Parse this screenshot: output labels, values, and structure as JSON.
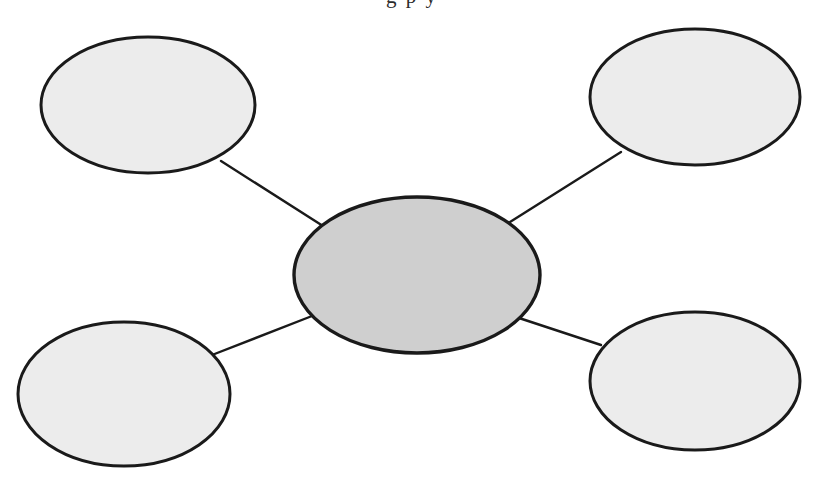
{
  "page": {
    "background_color": "#ffffff",
    "width": 824,
    "height": 480
  },
  "heading": {
    "clipped_fragment": "g p y",
    "note": "partially cropped text at top edge"
  },
  "style": {
    "outline_color": "#1a1a1a",
    "center_fill": "#cfcfcf",
    "outer_fill": "#ececec",
    "connector_color": "#1a1a1a",
    "outline_width": 3,
    "connector_width": 2
  },
  "diagram": {
    "type": "bubble-map",
    "center_node": {
      "id": "center",
      "label": "",
      "cx": 417,
      "cy": 275,
      "rx": 123,
      "ry": 78,
      "fill": "#cfcfcf"
    },
    "outer_nodes": [
      {
        "id": "top-left",
        "label": "",
        "cx": 148,
        "cy": 105,
        "rx": 107,
        "ry": 68,
        "fill": "#ececec"
      },
      {
        "id": "top-right",
        "label": "",
        "cx": 695,
        "cy": 97,
        "rx": 105,
        "ry": 68,
        "fill": "#ececec"
      },
      {
        "id": "bottom-left",
        "label": "",
        "cx": 124,
        "cy": 394,
        "rx": 106,
        "ry": 72,
        "fill": "#ececec"
      },
      {
        "id": "bottom-right",
        "label": "",
        "cx": 695,
        "cy": 381,
        "rx": 105,
        "ry": 69,
        "fill": "#ececec"
      }
    ],
    "connectors": [
      {
        "id": "center-to-top-left",
        "from": "top-left",
        "to": "center",
        "x1": 221,
        "y1": 161,
        "x2": 323,
        "y2": 226
      },
      {
        "id": "center-to-top-right",
        "from": "top-right",
        "to": "center",
        "x1": 621,
        "y1": 152,
        "x2": 510,
        "y2": 222
      },
      {
        "id": "center-to-bottom-left",
        "from": "bottom-left",
        "to": "center",
        "x1": 212,
        "y1": 355,
        "x2": 312,
        "y2": 316
      },
      {
        "id": "center-to-bottom-right",
        "from": "bottom-right",
        "to": "center",
        "x1": 601,
        "y1": 345,
        "x2": 519,
        "y2": 318
      }
    ]
  }
}
